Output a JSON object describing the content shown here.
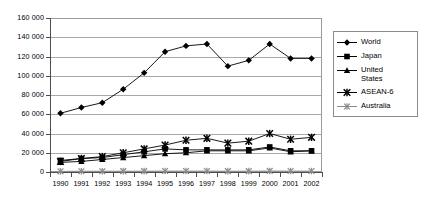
{
  "chart_data": {
    "type": "line",
    "title": "",
    "subtitle": "",
    "xlabel": "",
    "ylabel": "",
    "categories": [
      "1990",
      "1991",
      "1992",
      "1993",
      "1994",
      "1995",
      "1996",
      "1997",
      "1998",
      "1999",
      "2000",
      "2001",
      "2002"
    ],
    "ylim": [
      0,
      160000
    ],
    "y_ticks": [
      0,
      20000,
      40000,
      60000,
      80000,
      100000,
      120000,
      140000,
      160000
    ],
    "y_tick_labels": [
      "0",
      "20000",
      "40000",
      "60000",
      "80000",
      "100000",
      "120000",
      "140000",
      "160000"
    ],
    "grid": true,
    "legend_position": "right",
    "series": [
      {
        "name": "World",
        "marker": "diamond",
        "color": "#000000",
        "values": [
          61000,
          67000,
          72000,
          86000,
          103000,
          125000,
          131000,
          133000,
          110000,
          116000,
          133000,
          118000,
          118000
        ]
      },
      {
        "name": "Japan",
        "marker": "square",
        "color": "#000000",
        "values": [
          12000,
          14000,
          15000,
          18000,
          21000,
          24000,
          23000,
          23000,
          23000,
          23000,
          26000,
          22000,
          22000
        ]
      },
      {
        "name": "United\nStates",
        "marker": "triangle",
        "color": "#000000",
        "values": [
          10000,
          11000,
          13000,
          15000,
          17000,
          19000,
          20000,
          22000,
          22000,
          22000,
          25000,
          21000,
          22000
        ]
      },
      {
        "name": "ASEAN-6",
        "marker": "cross",
        "color": "#000000",
        "values": [
          11000,
          14000,
          16000,
          20000,
          24000,
          28000,
          33000,
          35000,
          30000,
          32000,
          40000,
          34000,
          36000
        ]
      },
      {
        "name": "Australia",
        "marker": "asterisk",
        "color": "#8a8a8a",
        "values": [
          700,
          800,
          800,
          900,
          900,
          1000,
          1000,
          1000,
          900,
          900,
          1100,
          1000,
          1000
        ]
      }
    ]
  },
  "legend": {
    "items": [
      {
        "label": "World",
        "marker": "diamond"
      },
      {
        "label": "Japan",
        "marker": "square"
      },
      {
        "label": "United\nStates",
        "marker": "triangle"
      },
      {
        "label": "ASEAN-6",
        "marker": "cross"
      },
      {
        "label": "Australia",
        "marker": "asterisk"
      }
    ]
  }
}
